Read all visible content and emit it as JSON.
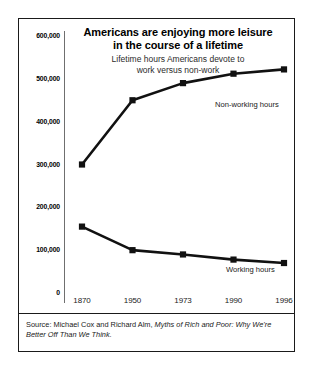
{
  "figure": {
    "title_line1": "Americans are enjoying more leisure",
    "title_line2": "in the course of a lifetime",
    "subtitle_line1": "Lifetime hours Americans devote to",
    "subtitle_line2": "work versus non-work",
    "source_prefix": "Source: Michael Cox and Richard Alm, ",
    "source_title": "Myths of Rich and Poor: Why We're Better Off Than We Think.",
    "colors": {
      "ink": "#000000",
      "line": "#111111",
      "axis": "#6f6f6f",
      "border": "#1a1a1a",
      "background": "#ffffff"
    }
  },
  "chart_data": {
    "type": "line",
    "title": "Americans are enjoying more leisure in the course of a lifetime",
    "subtitle": "Lifetime hours Americans devote to work versus non-work",
    "xlabel": "",
    "ylabel": "",
    "categories": [
      "1870",
      "1950",
      "1973",
      "1990",
      "1996"
    ],
    "ylim": [
      0,
      600000
    ],
    "yticks": [
      0,
      100000,
      200000,
      300000,
      400000,
      500000,
      600000
    ],
    "ytick_labels": [
      "0",
      "100,000",
      "200,000",
      "300,000",
      "400,000",
      "500,000",
      "600,000"
    ],
    "grid": false,
    "legend": "inline-annotations",
    "series": [
      {
        "name": "Non-working hours",
        "values": [
          300000,
          450000,
          490000,
          512000,
          522000
        ],
        "marker": "square",
        "label_position": "upper-right"
      },
      {
        "name": "Working hours",
        "values": [
          155000,
          100000,
          90000,
          78000,
          70000
        ],
        "marker": "square",
        "label_position": "mid-right"
      }
    ]
  }
}
